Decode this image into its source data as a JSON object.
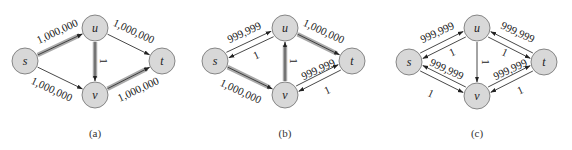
{
  "figure": {
    "colors": {
      "node_fill": "#d8d8d8",
      "node_stroke": "#7a7a7a",
      "edge": "#333333",
      "highlight_band": "#a9a9a9"
    },
    "panels": [
      {
        "caption": "(a)",
        "caption_pos": [
          95,
          133
        ],
        "nodes": [
          {
            "id": "s",
            "label": "s",
            "x": 25,
            "y": 61
          },
          {
            "id": "u",
            "label": "u",
            "x": 95,
            "y": 28
          },
          {
            "id": "v",
            "label": "v",
            "x": 95,
            "y": 95
          },
          {
            "id": "t",
            "label": "t",
            "x": 162,
            "y": 61
          }
        ],
        "edges": [
          {
            "from": "s",
            "to": "u",
            "label": "1,000,000",
            "highlight": true,
            "offset": 0,
            "label_pos": [
              57,
              31
            ],
            "label_angle": -25
          },
          {
            "from": "s",
            "to": "v",
            "label": "1,000,000",
            "highlight": false,
            "offset": 0,
            "label_pos": [
              52,
              89
            ],
            "label_angle": 25
          },
          {
            "from": "u",
            "to": "t",
            "label": "1,000,000",
            "highlight": false,
            "offset": 0,
            "label_pos": [
              134,
              31
            ],
            "label_angle": 25
          },
          {
            "from": "v",
            "to": "t",
            "label": "1,000,000",
            "highlight": true,
            "offset": 0,
            "label_pos": [
              138,
              89
            ],
            "label_angle": -25
          },
          {
            "from": "u",
            "to": "v",
            "label": "1",
            "highlight": true,
            "offset": 0,
            "label_pos": [
              104,
              61
            ],
            "label_angle": 90
          }
        ]
      },
      {
        "caption": "(b)",
        "caption_pos": [
          285,
          133
        ],
        "nodes": [
          {
            "id": "s",
            "label": "s",
            "x": 215,
            "y": 61
          },
          {
            "id": "u",
            "label": "u",
            "x": 285,
            "y": 28
          },
          {
            "id": "v",
            "label": "v",
            "x": 285,
            "y": 95
          },
          {
            "id": "t",
            "label": "t",
            "x": 352,
            "y": 61
          }
        ],
        "edges": [
          {
            "from": "s",
            "to": "u",
            "label": "999,999",
            "highlight": false,
            "offset": -3,
            "label_pos": [
              244,
              32
            ],
            "label_angle": -25
          },
          {
            "from": "u",
            "to": "s",
            "label": "1",
            "highlight": false,
            "offset": -3,
            "label_pos": [
              256,
              55
            ],
            "label_angle": -25
          },
          {
            "from": "s",
            "to": "v",
            "label": "1,000,000",
            "highlight": true,
            "offset": 0,
            "label_pos": [
              241,
              91
            ],
            "label_angle": 25
          },
          {
            "from": "u",
            "to": "t",
            "label": "1,000,000",
            "highlight": true,
            "offset": 0,
            "label_pos": [
              324,
              31
            ],
            "label_angle": 25
          },
          {
            "from": "v",
            "to": "t",
            "label": "999,999",
            "highlight": false,
            "offset": -3,
            "label_pos": [
              318,
              69
            ],
            "label_angle": -25
          },
          {
            "from": "t",
            "to": "v",
            "label": "1",
            "highlight": false,
            "offset": -3,
            "label_pos": [
              327,
              90
            ],
            "label_angle": -25
          },
          {
            "from": "v",
            "to": "u",
            "label": "1",
            "highlight": true,
            "offset": 0,
            "label_pos": [
              294,
              61
            ],
            "label_angle": 90
          }
        ]
      },
      {
        "caption": "(c)",
        "caption_pos": [
          477,
          133
        ],
        "nodes": [
          {
            "id": "s",
            "label": "s",
            "x": 409,
            "y": 62
          },
          {
            "id": "u",
            "label": "u",
            "x": 477,
            "y": 28
          },
          {
            "id": "v",
            "label": "v",
            "x": 477,
            "y": 96
          },
          {
            "id": "t",
            "label": "t",
            "x": 544,
            "y": 62
          }
        ],
        "edges": [
          {
            "from": "s",
            "to": "u",
            "label": "999,999",
            "highlight": false,
            "offset": -3,
            "label_pos": [
              437,
              32
            ],
            "label_angle": -25
          },
          {
            "from": "u",
            "to": "s",
            "label": "1",
            "highlight": false,
            "offset": -3,
            "label_pos": [
              452,
              52
            ],
            "label_angle": -25
          },
          {
            "from": "s",
            "to": "v",
            "label": "999,999",
            "highlight": false,
            "offset": 3,
            "label_pos": [
              447,
              69
            ],
            "label_angle": 25
          },
          {
            "from": "v",
            "to": "s",
            "label": "1",
            "highlight": false,
            "offset": 3,
            "label_pos": [
              431,
              93
            ],
            "label_angle": 25
          },
          {
            "from": "u",
            "to": "t",
            "label": "999,999",
            "highlight": false,
            "offset": 3,
            "label_pos": [
              518,
              32
            ],
            "label_angle": 25
          },
          {
            "from": "t",
            "to": "u",
            "label": "1",
            "highlight": false,
            "offset": 3,
            "label_pos": [
              505,
              52
            ],
            "label_angle": 25
          },
          {
            "from": "v",
            "to": "t",
            "label": "999,999",
            "highlight": false,
            "offset": -3,
            "label_pos": [
              510,
              69
            ],
            "label_angle": -25
          },
          {
            "from": "t",
            "to": "v",
            "label": "1",
            "highlight": false,
            "offset": -3,
            "label_pos": [
              520,
              90
            ],
            "label_angle": -25
          },
          {
            "from": "u",
            "to": "v",
            "label": "1",
            "highlight": false,
            "offset": 0,
            "label_pos": [
              486,
              62
            ],
            "label_angle": 90
          }
        ]
      }
    ]
  }
}
